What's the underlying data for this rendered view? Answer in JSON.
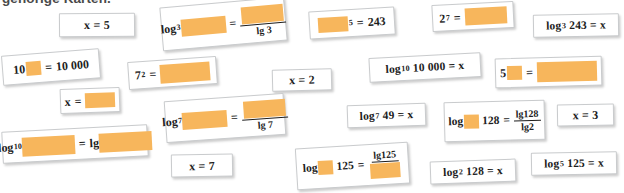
{
  "heading": {
    "text": "gehörige Karten."
  },
  "palette": {
    "blank_fill": "#f7b65c",
    "card_bg": "#ffffff",
    "card_border": "#c9cbcd",
    "text": "#1d1d1d",
    "heading_text": "#4a4a4a"
  },
  "cards": [
    {
      "id": "x-equals-5",
      "name": "card-x-equals-5",
      "kind": "plain",
      "text": "x = 5",
      "x": 59,
      "y": 13,
      "w": 76,
      "h": 24,
      "rot": -0.5,
      "fs": 12
    },
    {
      "id": "log3-blank-over-lg3",
      "name": "card-log3-blank-fraction",
      "kind": "expr",
      "text": "log₃ ■ = ■ / lg 3",
      "x": 161,
      "y": 2,
      "w": 125,
      "h": 44,
      "rot": -5.0,
      "fs": 12
    },
    {
      "id": "blank-pow5-equals-243",
      "name": "card-blank-power-5-equals-243",
      "kind": "expr",
      "text": "■⁵ = 243",
      "x": 309,
      "y": 9,
      "w": 86,
      "h": 28,
      "rot": -3.5,
      "fs": 12
    },
    {
      "id": "2-pow-7-equals-blank",
      "name": "card-2-power-7-equals-blank",
      "kind": "expr",
      "text": "2⁷ = ■",
      "x": 432,
      "y": 3,
      "w": 82,
      "h": 27,
      "rot": -3.0,
      "fs": 12
    },
    {
      "id": "log3-243-equals-x",
      "name": "card-log3-243-equals-x",
      "kind": "plain",
      "text": "log₃ 243 = x",
      "x": 533,
      "y": 14,
      "w": 86,
      "h": 23,
      "rot": -1.0,
      "fs": 11.5
    },
    {
      "id": "10-pow-blank-equals-10000",
      "name": "card-10-power-blank-equals-10000",
      "kind": "expr",
      "text": "10■ = 10 000",
      "x": 2,
      "y": 52,
      "w": 98,
      "h": 30,
      "rot": -4.5,
      "fs": 12
    },
    {
      "id": "7-squared-equals-blank",
      "name": "card-7-squared-equals-blank",
      "kind": "expr",
      "text": "7² = ■",
      "x": 128,
      "y": 59,
      "w": 89,
      "h": 28,
      "rot": -4.0,
      "fs": 12
    },
    {
      "id": "x-equals-2",
      "name": "card-x-equals-2",
      "kind": "plain",
      "text": "x = 2",
      "x": 272,
      "y": 69,
      "w": 60,
      "h": 22,
      "rot": -1.5,
      "fs": 12
    },
    {
      "id": "log10-10000-equals-x",
      "name": "card-log10-10000-equals-x",
      "kind": "plain",
      "text": "log₁₀ 10 000 = x",
      "x": 369,
      "y": 55,
      "w": 112,
      "h": 25,
      "rot": -3.0,
      "fs": 11.5
    },
    {
      "id": "5-pow-blank-equals-blank",
      "name": "card-5-power-blank-equals-blank",
      "kind": "expr",
      "text": "5■ = ■",
      "x": 495,
      "y": 57,
      "w": 107,
      "h": 30,
      "rot": -1.5,
      "fs": 12
    },
    {
      "id": "x-equals-blank",
      "name": "card-x-equals-blank",
      "kind": "expr",
      "text": "x = ■",
      "x": 60,
      "y": 88,
      "w": 60,
      "h": 25,
      "rot": -2.0,
      "fs": 12
    },
    {
      "id": "log7-blank-over-lg7",
      "name": "card-log7-blank-fraction",
      "kind": "expr",
      "text": "log₇ ■ = ■ / lg 7",
      "x": 165,
      "y": 97,
      "w": 120,
      "h": 42,
      "rot": -4.0,
      "fs": 12
    },
    {
      "id": "log7-49-equals-x",
      "name": "card-log7-49-equals-x",
      "kind": "plain",
      "text": "log₇ 49 = x",
      "x": 347,
      "y": 104,
      "w": 79,
      "h": 23,
      "rot": -2.0,
      "fs": 11.5
    },
    {
      "id": "log-blank-128-frac-lg128-lg2",
      "name": "card-log-blank-128-fraction",
      "kind": "expr",
      "text": "log■ 128 = lg128 / lg2",
      "x": 444,
      "y": 101,
      "w": 101,
      "h": 40,
      "rot": -1.5,
      "fs": 11.5
    },
    {
      "id": "x-equals-3",
      "name": "card-x-equals-3",
      "kind": "plain",
      "text": "x = 3",
      "x": 557,
      "y": 104,
      "w": 57,
      "h": 22,
      "rot": -1.0,
      "fs": 12
    },
    {
      "id": "log10-blank-equals-lg-blank",
      "name": "card-log10-blank-equals-lg-blank",
      "kind": "expr",
      "text": "log₁₀ ■ = lg ■",
      "x": 2,
      "y": 128,
      "w": 146,
      "h": 32,
      "rot": -3.0,
      "fs": 12
    },
    {
      "id": "x-equals-7",
      "name": "card-x-equals-7",
      "kind": "plain",
      "text": "x = 7",
      "x": 171,
      "y": 154,
      "w": 62,
      "h": 23,
      "rot": -1.0,
      "fs": 12
    },
    {
      "id": "log-blank-125-frac-lg125-blank",
      "name": "card-log-blank-125-fraction",
      "kind": "expr",
      "text": "log■ 125 = lg125 / ■",
      "x": 296,
      "y": 145,
      "w": 113,
      "h": 42,
      "rot": -3.5,
      "fs": 11.5
    },
    {
      "id": "log2-128-equals-x",
      "name": "card-log2-128-equals-x",
      "kind": "plain",
      "text": "log₂ 128 = x",
      "x": 430,
      "y": 160,
      "w": 86,
      "h": 23,
      "rot": -2.0,
      "fs": 11.5
    },
    {
      "id": "log5-125-equals-x",
      "name": "card-log5-125-equals-x",
      "kind": "plain",
      "text": "log₅ 125 = x",
      "x": 531,
      "y": 152,
      "w": 86,
      "h": 23,
      "rot": -1.0,
      "fs": 11.5
    }
  ]
}
